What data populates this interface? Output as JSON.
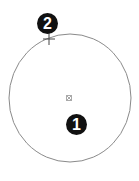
{
  "diagram": {
    "circle": {
      "cx": 70,
      "cy": 98,
      "rx": 61,
      "ry": 64,
      "stroke": "#888888"
    },
    "center_marker": {
      "x": 69,
      "y": 98,
      "label": "center-point"
    },
    "start_point": {
      "x": 49,
      "y": 39,
      "label": "cross-marker"
    },
    "callouts": [
      {
        "number": "1",
        "x": 76,
        "y": 124
      },
      {
        "number": "2",
        "x": 47,
        "y": 23
      }
    ]
  }
}
